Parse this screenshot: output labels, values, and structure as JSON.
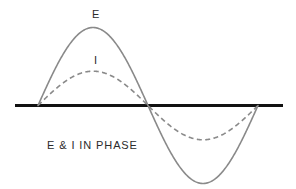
{
  "figure": {
    "title_label_voltage": "E",
    "title_label_current": "I",
    "caption": "E & I IN PHASE",
    "background_color": "#ffffff",
    "axis_color": "#111111",
    "curve_color": "#8a8a8a"
  },
  "chart_data": {
    "type": "line",
    "title": "E & I IN PHASE",
    "subtitle": "",
    "xlabel": "",
    "ylabel": "",
    "grid": false,
    "legend_position": "inline-annotations",
    "annotations": [
      {
        "text": "E",
        "x": 0.25,
        "y": 1.0,
        "describes": "voltage sine wave peak"
      },
      {
        "text": "I",
        "x": 0.26,
        "y": 0.44,
        "describes": "current sine wave peak"
      },
      {
        "text": "E & I IN PHASE",
        "x": 0.1,
        "y": -0.35,
        "describes": "caption"
      }
    ],
    "x": [
      0,
      0.0625,
      0.125,
      0.1875,
      0.25,
      0.3125,
      0.375,
      0.4375,
      0.5,
      0.5625,
      0.625,
      0.6875,
      0.75,
      0.8125,
      0.875,
      0.9375,
      1
    ],
    "xlim": [
      0,
      1
    ],
    "ylim": [
      -1.12,
      1.12
    ],
    "x_axis_line_y": 0,
    "series": [
      {
        "name": "E",
        "label": "E",
        "style": "solid",
        "color": "#8a8a8a",
        "amplitude": 1.0,
        "phase_degrees": 0,
        "cycles": 1,
        "values": [
          0,
          0.3827,
          0.7071,
          0.9239,
          1.0,
          0.9239,
          0.7071,
          0.3827,
          0,
          -0.3827,
          -0.7071,
          -0.9239,
          -1.0,
          -0.9239,
          -0.7071,
          -0.3827,
          0
        ]
      },
      {
        "name": "I",
        "label": "I",
        "style": "dashed",
        "color": "#8a8a8a",
        "amplitude": 0.44,
        "phase_degrees": 0,
        "cycles": 1,
        "values": [
          0,
          0.1684,
          0.3111,
          0.4065,
          0.44,
          0.4065,
          0.3111,
          0.1684,
          0,
          -0.1684,
          -0.3111,
          -0.4065,
          -0.44,
          -0.4065,
          -0.3111,
          -0.1684,
          0
        ]
      }
    ]
  }
}
